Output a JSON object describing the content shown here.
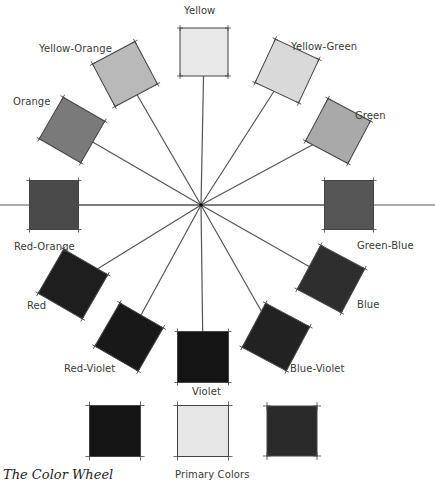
{
  "diagram": {
    "title": "The Color Wheel",
    "center": [
      201,
      205
    ],
    "horizontal_line": {
      "x1": 0,
      "x2": 435,
      "y": 205
    },
    "swatches": [
      {
        "name": "Yellow",
        "cx": 204,
        "cy": 52,
        "size": 48,
        "rot": 0,
        "color": "#e9e9e9",
        "label": "Yellow"
      },
      {
        "name": "Yellow-Green",
        "cx": 287,
        "cy": 71,
        "size": 48,
        "rot": 25,
        "color": "#d9d9d9",
        "label": "Yellow-Green"
      },
      {
        "name": "Green",
        "cx": 338,
        "cy": 131,
        "size": 48,
        "rot": 28,
        "color": "#a9a9a9",
        "label": "Green"
      },
      {
        "name": "Green-Blue",
        "cx": 349,
        "cy": 205,
        "size": 49,
        "rot": 0,
        "color": "#555555",
        "label": "Green-Blue"
      },
      {
        "name": "Blue",
        "cx": 331,
        "cy": 279,
        "size": 50,
        "rot": 28,
        "color": "#2e2e2e",
        "label": "Blue"
      },
      {
        "name": "Blue-Violet",
        "cx": 276,
        "cy": 337,
        "size": 50,
        "rot": 28,
        "color": "#222222",
        "label": "Blue-Violet"
      },
      {
        "name": "Violet",
        "cx": 203,
        "cy": 357,
        "size": 51,
        "rot": 0,
        "color": "#141414",
        "label": "Violet"
      },
      {
        "name": "Red-Violet",
        "cx": 129,
        "cy": 337,
        "size": 50,
        "rot": 30,
        "color": "#181818",
        "label": "Red-Violet"
      },
      {
        "name": "Red",
        "cx": 73,
        "cy": 284,
        "size": 51,
        "rot": 30,
        "color": "#1e1e1e",
        "label": "Red"
      },
      {
        "name": "Red-Orange",
        "cx": 54,
        "cy": 205,
        "size": 49,
        "rot": 0,
        "color": "#4a4a4a",
        "label": "Red-Orange"
      },
      {
        "name": "Orange",
        "cx": 72,
        "cy": 130,
        "size": 48,
        "rot": 30,
        "color": "#7a7a7a",
        "label": "Orange"
      },
      {
        "name": "Yellow-Orange",
        "cx": 125,
        "cy": 74,
        "size": 48,
        "rot": -28,
        "color": "#b9b9b9",
        "label": "Yellow-Orange"
      }
    ],
    "primary_swatches": [
      {
        "name": "Primary Red",
        "cx": 115,
        "cy": 431,
        "size": 51,
        "color": "#141414"
      },
      {
        "name": "Primary Yellow",
        "cx": 203,
        "cy": 431,
        "size": 51,
        "color": "#e6e6e6"
      },
      {
        "name": "Primary Blue",
        "cx": 292,
        "cy": 431,
        "size": 50,
        "color": "#2a2a2a"
      }
    ],
    "labels": {
      "yellow": "Yellow",
      "yellow_green": "Yellow-Green",
      "green": "Green",
      "green_blue": "Green-Blue",
      "blue": "Blue",
      "blue_violet": "Blue-Violet",
      "violet": "Violet",
      "red_violet": "Red-Violet",
      "red": "Red",
      "red_orange": "Red-Orange",
      "orange": "Orange",
      "yellow_orange": "Yellow-Orange",
      "primary_colors": "Primary Colors"
    },
    "line_color": "#555555"
  }
}
